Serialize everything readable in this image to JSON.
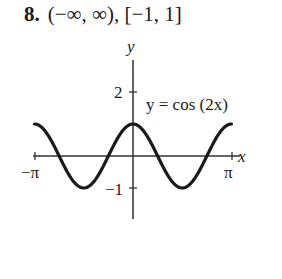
{
  "problem": {
    "number": "8.",
    "answer": "(−∞, ∞), [−1, 1]"
  },
  "chart_data": {
    "type": "line",
    "title": "",
    "function_label": "y = cos (2x)",
    "xlabel": "x",
    "ylabel": "y",
    "x_ticks": [
      {
        "value": -3.14159,
        "label": "−π"
      },
      {
        "value": 3.14159,
        "label": "π"
      }
    ],
    "y_ticks": [
      {
        "value": 2,
        "label": "2"
      },
      {
        "value": -1,
        "label": "−1"
      }
    ],
    "xlim": [
      -3.14159,
      3.14159
    ],
    "ylim": [
      -1.9,
      2.9
    ],
    "grid": false,
    "series": [
      {
        "name": "y = cos(2x)",
        "x": [
          -3.14159,
          -2.35619,
          -1.5708,
          -0.7854,
          0,
          0.7854,
          1.5708,
          2.35619,
          3.14159
        ],
        "values": [
          1,
          0,
          -1,
          0,
          1,
          0,
          -1,
          0,
          1
        ]
      }
    ],
    "color": "#1a1a1a"
  }
}
